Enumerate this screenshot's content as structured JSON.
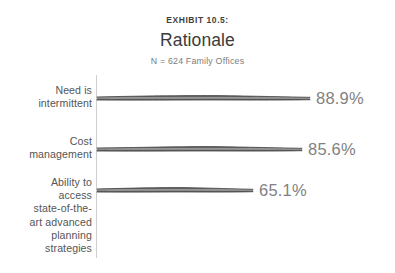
{
  "header": {
    "exhibit_label": "EXHIBIT 10.5:",
    "title": "Rationale",
    "subtitle": "N = 624 Family Offices"
  },
  "colors": {
    "background": "#ffffff",
    "axis": "#cfcfcf",
    "bar_dark": "#4a4a4a",
    "bar_mid": "#6e6e6e",
    "bar_light": "#9a9a9a",
    "label_text": "#555555",
    "value_text": "#818181",
    "title_text": "#3b3b3b",
    "subtitle_text": "#7c7c7c"
  },
  "chart_data": {
    "type": "bar",
    "orientation": "horizontal",
    "title": "Rationale",
    "subtitle": "N = 624 Family Offices",
    "xlabel": "",
    "ylabel": "",
    "xlim": [
      0,
      100
    ],
    "grid": false,
    "legend": false,
    "categories": [
      "Need is intermittent",
      "Cost management",
      "Ability to access state-of-the-art advanced planning strategies"
    ],
    "values": [
      88.9,
      85.6,
      65.1
    ],
    "value_labels": [
      "88.9%",
      "85.6%",
      "65.1%"
    ]
  },
  "bars": [
    {
      "label": "Need is\nintermittent",
      "value_label": "88.9%",
      "label_top": 84,
      "label_width": 84,
      "bar_center_y": 98,
      "bar_width": 213,
      "value_left": 316,
      "value_top": 89
    },
    {
      "label": "Cost\nmanagement",
      "value_label": "85.6%",
      "label_top": 135,
      "label_width": 84,
      "bar_center_y": 149,
      "bar_width": 205,
      "value_left": 308,
      "value_top": 140
    },
    {
      "label": "Ability to\naccess\nstate-of-the-\nart advanced\nplanning\nstrategies",
      "value_label": "65.1%",
      "label_top": 176,
      "label_width": 84,
      "bar_center_y": 190,
      "bar_width": 156,
      "value_left": 259,
      "value_top": 181
    }
  ]
}
